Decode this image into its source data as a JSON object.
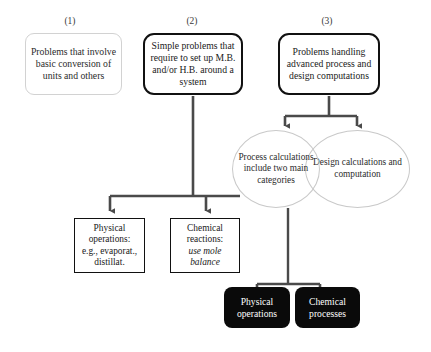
{
  "diagram": {
    "background_color": "#ffffff",
    "captions": [
      {
        "label": "(1)",
        "x": 70,
        "y": 16
      },
      {
        "label": "(2)",
        "x": 192,
        "y": 16
      },
      {
        "label": "(3)",
        "x": 327,
        "y": 16
      }
    ],
    "top_nodes": [
      {
        "id": "node-1",
        "name": "problems-basic-conversion",
        "style": "soft",
        "text": "Problems that involve basic conversion of units and others",
        "x": 25,
        "y": 33,
        "w": 97,
        "h": 62
      },
      {
        "id": "node-2",
        "name": "simple-problems-mb-hb",
        "style": "bold",
        "text": "Simple problems that require to set up M.B. and/or H.B. around a system",
        "x": 143,
        "y": 33,
        "w": 100,
        "h": 62
      },
      {
        "id": "node-3",
        "name": "problems-advanced-process-design",
        "style": "bold",
        "text": "Problems handling advanced process and design computations",
        "x": 278,
        "y": 33,
        "w": 102,
        "h": 62
      }
    ],
    "ellipses": [
      {
        "id": "ellipse-process",
        "name": "process-calculations-ellipse",
        "text": "Process calculations include two main categories",
        "x": 232,
        "y": 130,
        "w": 88,
        "h": 78,
        "layer": "front"
      },
      {
        "id": "ellipse-design",
        "name": "design-calculations-ellipse",
        "text": "Design calculations and computation",
        "x": 305,
        "y": 130,
        "w": 105,
        "h": 78,
        "layer": "behind"
      }
    ],
    "mid_nodes": [
      {
        "id": "node-physical-operations",
        "name": "physical-operations-box",
        "style": "square",
        "lines": [
          "Physical",
          "operations:",
          "e.g., evaporat.,",
          "distillat."
        ],
        "italic_lines": [],
        "x": 74,
        "y": 218,
        "w": 71,
        "h": 55
      },
      {
        "id": "node-chemical-reactions",
        "name": "chemical-reactions-box",
        "style": "square",
        "lines": [
          "Chemical",
          "reactions:",
          "use mole",
          "balance"
        ],
        "italic_lines": [
          2,
          3
        ],
        "x": 170,
        "y": 218,
        "w": 70,
        "h": 55
      }
    ],
    "bottom_nodes": [
      {
        "id": "node-physical-operations-filled",
        "name": "physical-operations-filled-box",
        "style": "filled",
        "text": "Physical operations",
        "x": 224,
        "y": 287,
        "w": 66,
        "h": 41
      },
      {
        "id": "node-chemical-processes-filled",
        "name": "chemical-processes-filled-box",
        "style": "filled",
        "text": "Chemical processes",
        "x": 295,
        "y": 287,
        "w": 65,
        "h": 41
      }
    ],
    "connector_color": "#4a4a4a",
    "connector_color_dark": "#3a3a3a"
  }
}
